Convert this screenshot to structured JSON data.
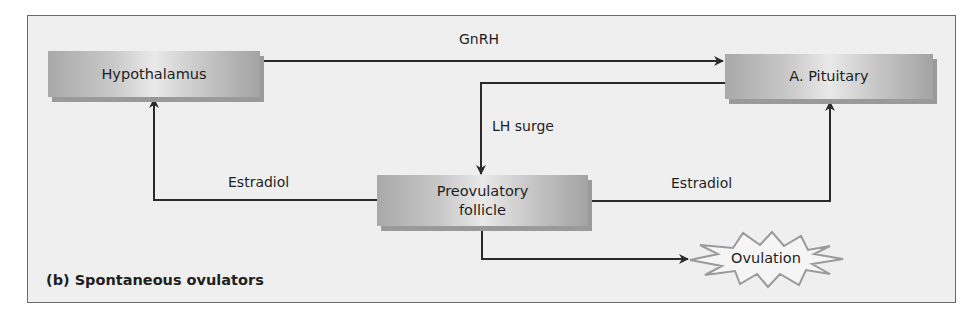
{
  "diagram": {
    "caption": "(b) Spontaneous ovulators",
    "nodes": {
      "hypothalamus": "Hypothalamus",
      "pituitary": "A. Pituitary",
      "follicle_line1": "Preovulatory",
      "follicle_line2": "follicle",
      "ovulation": "Ovulation"
    },
    "edges": {
      "gnrh": "GnRH",
      "lh_surge": "LH surge",
      "estradiol_left": "Estradiol",
      "estradiol_right": "Estradiol"
    },
    "colors": {
      "background": "#efefef",
      "line": "#2a2a2a",
      "box_dark": "#a3a3a3",
      "box_light": "#e9e9e9",
      "burst_stroke": "#9a9a9a"
    }
  }
}
